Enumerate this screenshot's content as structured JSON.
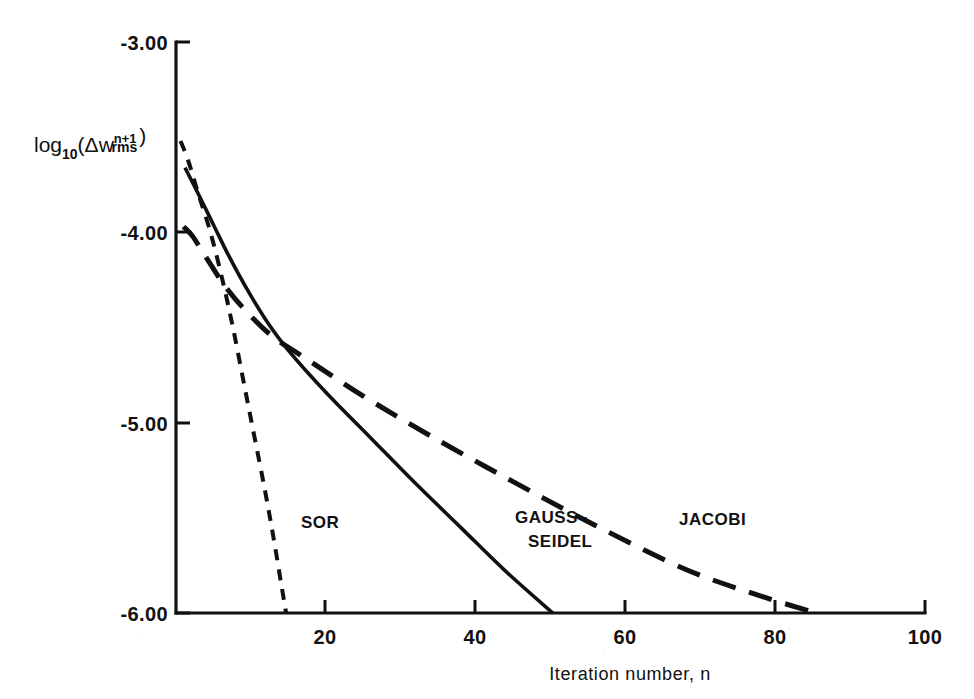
{
  "chart_data": {
    "type": "line",
    "title": "",
    "subtitle": "",
    "xlabel": "Iteration number, n",
    "ylabel": "log10(Δw_rms^(n+1))",
    "ylabel_parts": {
      "log_text": "log",
      "log_sub": "10",
      "paren_open": "(",
      "delta": "Δw",
      "var_sub": "rms",
      "var_sup": "n+1",
      "paren_close": ")"
    },
    "xlim": [
      0,
      100
    ],
    "ylim": [
      -6.0,
      -3.0
    ],
    "xticks": [
      0,
      20,
      40,
      60,
      80,
      100
    ],
    "xtick_labels": [
      "",
      "20",
      "40",
      "60",
      "80",
      "100"
    ],
    "yticks": [
      -3.0,
      -4.0,
      -5.0,
      -6.0
    ],
    "ytick_labels": [
      "-3.00",
      "-4.00",
      "-5.00",
      "-6.00"
    ],
    "grid": false,
    "legend_position": "inline-annotations",
    "series": [
      {
        "name": "SOR",
        "label": "SOR",
        "style": "short-dashed",
        "dasharray": "11 9",
        "stroke_width": 4,
        "color": "#111111",
        "label_x": 16.5,
        "label_y": -5.62,
        "x": [
          0.6,
          1.6,
          3.0,
          4.6,
          6.2,
          7.6,
          9.0,
          10.4,
          11.8,
          13.0,
          14.1,
          14.7
        ],
        "y": [
          -3.52,
          -3.62,
          -3.8,
          -4.0,
          -4.25,
          -4.5,
          -4.78,
          -5.06,
          -5.34,
          -5.6,
          -5.86,
          -6.0
        ]
      },
      {
        "name": "GAUSS-SEIDEL",
        "label_line1": "GAUSS–",
        "label_line2": "SEIDEL",
        "style": "solid",
        "dasharray": "none",
        "stroke_width": 3.6,
        "color": "#111111",
        "label_x": 41.5,
        "label_y": -5.6,
        "x": [
          1.2,
          3.0,
          5.0,
          7.0,
          9.5,
          12.0,
          15.0,
          20.0,
          26.0,
          32.0,
          38.0,
          44.0,
          50.3
        ],
        "y": [
          -3.66,
          -3.8,
          -3.96,
          -4.12,
          -4.3,
          -4.46,
          -4.62,
          -4.84,
          -5.08,
          -5.32,
          -5.55,
          -5.78,
          -6.0
        ]
      },
      {
        "name": "JACOBI",
        "label": "JACOBI",
        "style": "long-dashed",
        "dasharray": "24 14",
        "stroke_width": 5,
        "color": "#111111",
        "label_x": 67.0,
        "label_y": -5.58,
        "x": [
          1.0,
          2.2,
          4.0,
          6.5,
          9.5,
          13.0,
          18.0,
          25.0,
          34.0,
          45.0,
          56.0,
          68.0,
          78.0,
          85.5
        ],
        "y": [
          -3.97,
          -4.02,
          -4.13,
          -4.28,
          -4.42,
          -4.55,
          -4.68,
          -4.86,
          -5.07,
          -5.31,
          -5.54,
          -5.77,
          -5.91,
          -6.0
        ]
      }
    ]
  },
  "axes": {
    "x_axis_name": "x-axis",
    "y_axis_name": "y-axis"
  }
}
